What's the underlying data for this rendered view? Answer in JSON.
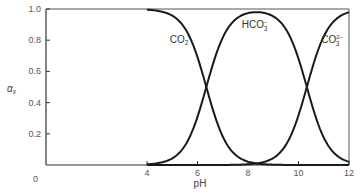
{
  "chart_data": {
    "type": "line",
    "title": "",
    "xlabel": "pH",
    "ylabel": "αx",
    "xlim": [
      0,
      12
    ],
    "ylim": [
      0,
      1.0
    ],
    "x_ticks": [
      0,
      4,
      6,
      8,
      10,
      12
    ],
    "x_tick_labels": [
      "0",
      "4",
      "6",
      "8",
      "10",
      "12"
    ],
    "y_ticks": [
      0,
      0.2,
      0.4,
      0.6,
      0.8,
      1.0
    ],
    "y_tick_labels": [
      "0",
      "0.2",
      "0.4",
      "0.6",
      "0.8",
      "1.0"
    ],
    "grid": false,
    "legend": "inline labels",
    "pKa1": 6.35,
    "pKa2": 10.33,
    "x": [
      4,
      4.5,
      5,
      5.5,
      6,
      6.35,
      6.5,
      7,
      7.5,
      8,
      8.34,
      8.5,
      9,
      9.5,
      10,
      10.33,
      10.5,
      11,
      11.5,
      12
    ],
    "series": [
      {
        "name": "CO2",
        "label_main": "CO",
        "label_sub": "2",
        "label_sup": "",
        "values": [
          0.996,
          0.986,
          0.957,
          0.876,
          0.691,
          0.5,
          0.414,
          0.183,
          0.066,
          0.022,
          0.01,
          0.007,
          0.002,
          0.001,
          0.0,
          0.0,
          0.0,
          0.0,
          0.0,
          0.0
        ]
      },
      {
        "name": "HCO3-",
        "label_main": "HCO",
        "label_sub": "3",
        "label_sup": "−",
        "values": [
          0.004,
          0.014,
          0.043,
          0.124,
          0.309,
          0.5,
          0.585,
          0.816,
          0.931,
          0.974,
          0.98,
          0.978,
          0.954,
          0.871,
          0.681,
          0.5,
          0.403,
          0.176,
          0.063,
          0.021
        ]
      },
      {
        "name": "CO3 2-",
        "label_main": "CO",
        "label_sub": "3",
        "label_sup": "2−",
        "values": [
          0.0,
          0.0,
          0.0,
          0.0,
          0.0,
          0.0,
          0.0,
          0.0,
          0.0,
          0.004,
          0.01,
          0.015,
          0.044,
          0.128,
          0.319,
          0.5,
          0.597,
          0.824,
          0.937,
          0.979
        ]
      }
    ],
    "annotations": [
      {
        "text": "CO2",
        "x": 4.9,
        "y": 0.78
      },
      {
        "text": "HCO3-",
        "x": 7.75,
        "y": 0.88
      },
      {
        "text": "CO3 2-",
        "x": 10.9,
        "y": 0.78
      }
    ]
  }
}
